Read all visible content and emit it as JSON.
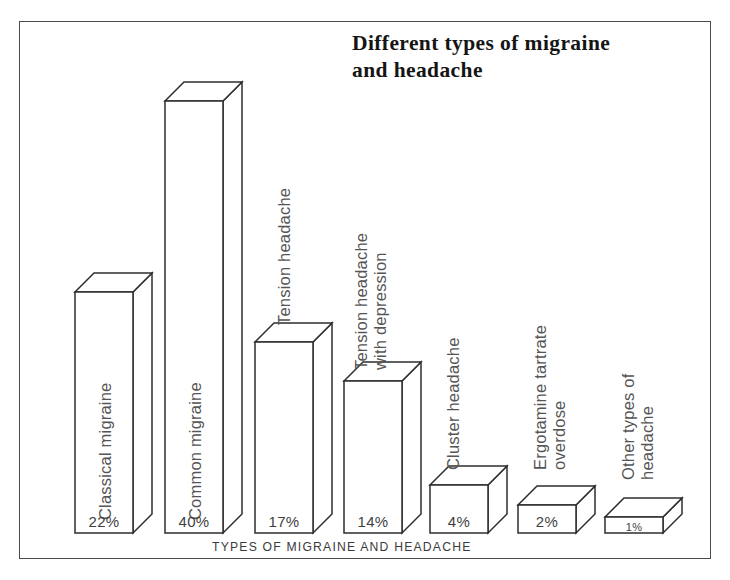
{
  "figure": {
    "title": "Different types of migraine\nand headache",
    "frame_color": "#4a4a4a",
    "background": "#ffffff",
    "line_color": "#2e2e2e"
  },
  "chart_data": {
    "type": "bar",
    "title": "Different types of migraine and headache",
    "xlabel": "TYPES OF MIGRAINE AND HEADACHE",
    "ylabel": "PERCENTAGE",
    "categories": [
      "Classical migraine",
      "Common migraine",
      "Tension headache",
      "Tension headache\nwith depression",
      "Cluster headache",
      "Ergotamine tartrate overdose",
      "Other types of headache"
    ],
    "values": [
      22,
      40,
      17,
      14,
      4,
      2,
      1
    ],
    "value_labels": [
      "22%",
      "40%",
      "17%",
      "14%",
      "4%",
      "2%",
      "1%"
    ],
    "ylim": [
      0,
      40
    ],
    "grid": false,
    "legend": null,
    "style": "3d-isometric-bars",
    "units": "percent"
  },
  "bars": [
    {
      "label": "Classical migraine",
      "value_label": "22%",
      "x": 75,
      "width": 58,
      "top": 292,
      "base": 533,
      "depth": 19
    },
    {
      "label": "Common migraine",
      "value_label": "40%",
      "x": 165,
      "width": 58,
      "top": 101,
      "base": 533,
      "depth": 19
    },
    {
      "label": "Tension headache",
      "value_label": "17%",
      "x": 255,
      "width": 58,
      "top": 342,
      "base": 533,
      "depth": 19
    },
    {
      "label": "Tension headache\nwith depression",
      "value_label": "14%",
      "x": 344,
      "width": 58,
      "top": 381,
      "base": 533,
      "depth": 19
    },
    {
      "label": "Cluster headache",
      "value_label": "4%",
      "x": 430,
      "width": 58,
      "top": 485,
      "base": 533,
      "depth": 19
    },
    {
      "label": "Ergotamine tartrate overdose",
      "value_label": "2%",
      "x": 518,
      "width": 58,
      "top": 505,
      "base": 533,
      "depth": 19
    },
    {
      "label": "Other types of headache",
      "value_label": "1%",
      "x": 605,
      "width": 58,
      "top": 517,
      "base": 533,
      "depth": 19
    }
  ]
}
